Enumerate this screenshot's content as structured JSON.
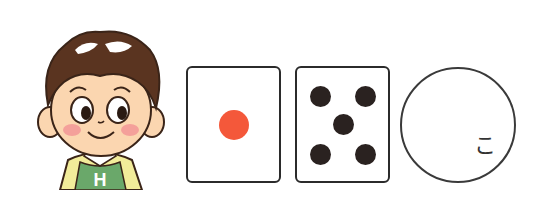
{
  "character": {
    "description": "cartoon boy with brown hair, green apron with H",
    "apron_letter": "H",
    "colors": {
      "hair": "#5a3420",
      "hair_highlight": "#ffffff",
      "skin": "#fbd6b0",
      "cheek": "#f4a09a",
      "shirt": "#f2ec9a",
      "apron": "#6aa86a",
      "collar": "#ffffff",
      "outline": "#3a2418"
    }
  },
  "cards": [
    {
      "name": "die-face-one",
      "pips": 1,
      "pip_color": "#f4583a"
    },
    {
      "name": "die-face-five",
      "pips": 5,
      "pip_color": "#2a2220"
    }
  ],
  "circle": {
    "label": "こ",
    "border_color": "#3a3a3a"
  }
}
